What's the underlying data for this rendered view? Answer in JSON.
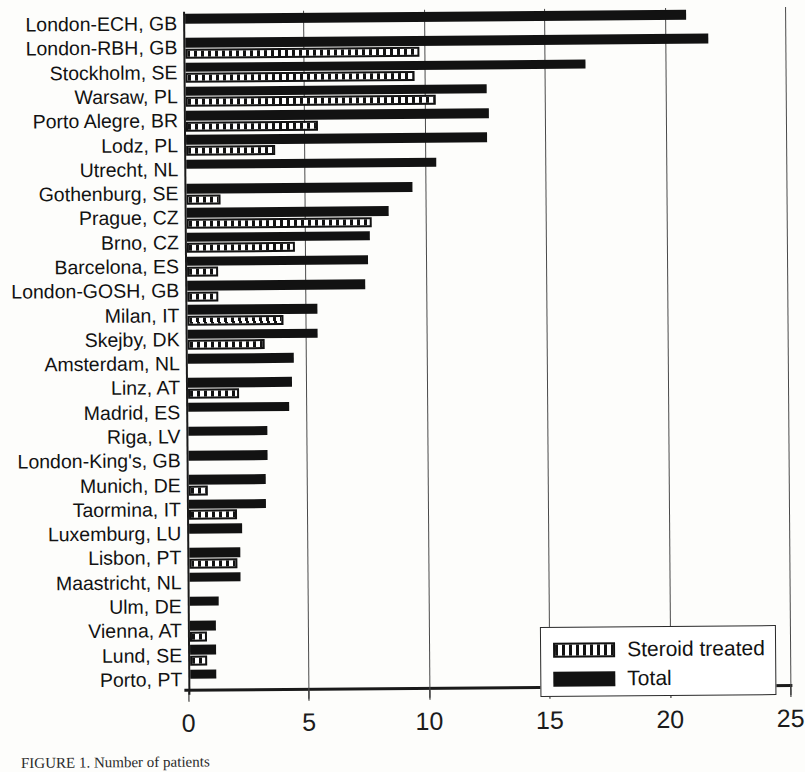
{
  "figure": {
    "caption": "FIGURE 1.  Number of patients",
    "legend": {
      "items": [
        {
          "label": "Steroid treated",
          "swatch": "hatched-bar-swatch"
        },
        {
          "label": "Total",
          "swatch": "solid-black-bar-swatch"
        }
      ]
    }
  },
  "chart_data": {
    "type": "bar",
    "orientation": "horizontal",
    "title": "",
    "xlabel": "",
    "ylabel": "",
    "xlim": [
      0,
      25
    ],
    "xticks": [
      0,
      5,
      10,
      15,
      20,
      25
    ],
    "xticklabels": [
      "0",
      "5",
      "10",
      "15",
      "20",
      "25"
    ],
    "grid": "vertical",
    "legend_position": "lower-right",
    "categories": [
      "London-ECH, GB",
      "London-RBH, GB",
      "Stockholm, SE",
      "Warsaw, PL",
      "Porto Alegre, BR",
      "Lodz, PL",
      "Utrecht, NL",
      "Gothenburg, SE",
      "Prague, CZ",
      "Brno, CZ",
      "Barcelona, ES",
      "London-GOSH, GB",
      "Milan, IT",
      "Skejby, DK",
      "Amsterdam, NL",
      "Linz, AT",
      "Madrid, ES",
      "Riga, LV",
      "London-King's, GB",
      "Munich, DE",
      "Taormina, IT",
      "Luxemburg, LU",
      "Lisbon, PT",
      "Maastricht, NL",
      "Ulm, DE",
      "Vienna, AT",
      "Lund, SE",
      "Porto, PT"
    ],
    "series": [
      {
        "name": "Total",
        "color": "#121212",
        "values": [
          20.8,
          21.7,
          16.6,
          12.5,
          12.6,
          12.5,
          10.4,
          9.4,
          8.4,
          7.6,
          7.5,
          7.4,
          5.4,
          5.4,
          4.4,
          4.3,
          4.2,
          3.3,
          3.3,
          3.2,
          3.2,
          2.2,
          2.1,
          2.1,
          1.2,
          1.1,
          1.1,
          1.1
        ]
      },
      {
        "name": "Steroid treated",
        "color": "#121212",
        "values": [
          0,
          9.7,
          9.5,
          10.4,
          5.5,
          3.7,
          0,
          1.4,
          7.7,
          4.5,
          1.3,
          1.3,
          4.0,
          3.2,
          0,
          2.1,
          0,
          0,
          0,
          0.8,
          2.0,
          0,
          2.0,
          0,
          0,
          0.7,
          0.7,
          0
        ]
      }
    ]
  }
}
